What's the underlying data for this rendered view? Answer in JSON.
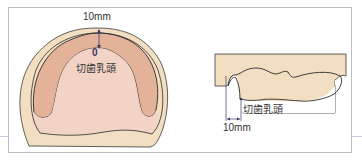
{
  "figure": {
    "left_view": {
      "name": "occlusal-view",
      "dimension_label": "10mm",
      "point_label": "0",
      "landmark_label": "切歯乳頭"
    },
    "right_view": {
      "name": "sagittal-view",
      "dimension_label": "10mm",
      "landmark_label": "切歯乳頭"
    },
    "colors": {
      "outer_base": "#f2dfc2",
      "ridge": "#e4b199",
      "palate": "#f3d3c6",
      "outline": "#2b2b2b",
      "frame": "#bdbdbd",
      "guide_line": "#c9cbe6",
      "arrow": "#3a3a6a"
    }
  }
}
